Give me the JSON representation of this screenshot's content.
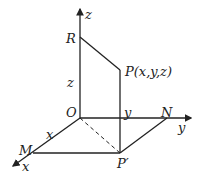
{
  "diagram": {
    "title": "",
    "labels": {
      "z_axis": "z",
      "y_axis": "y",
      "x_axis": "x",
      "R": "R",
      "P": "P(x,y,z)",
      "z_len": "z",
      "O": "O",
      "y_len": "y",
      "N": "N",
      "x_len": "x",
      "M": "M",
      "P_prime": "P′"
    },
    "colors": {
      "line": "#222222",
      "background": "#ffffff"
    }
  }
}
